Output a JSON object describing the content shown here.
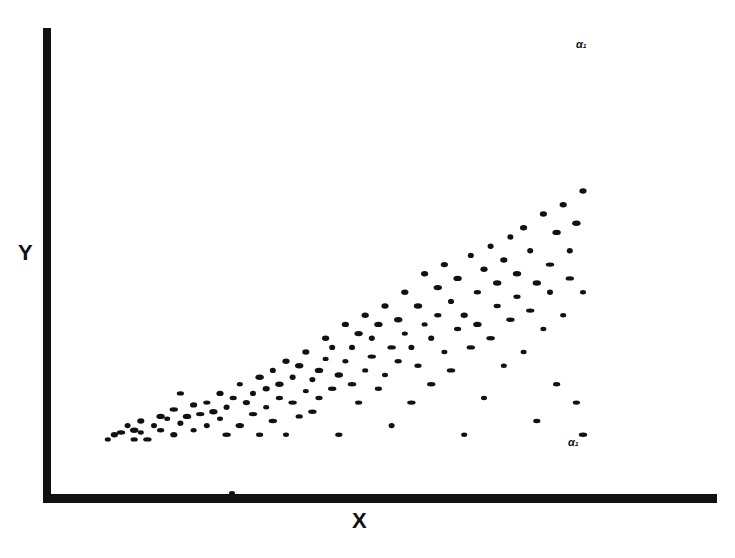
{
  "chart_data": {
    "type": "scatter",
    "title": "",
    "xlabel": "X",
    "ylabel": "Y",
    "grid": false,
    "legend": null,
    "ticks": {
      "x": [],
      "y": []
    },
    "xlim": [
      0,
      100
    ],
    "ylim": [
      0,
      100
    ],
    "annotations": [
      {
        "text": "α₁",
        "x": 82,
        "y": 98
      },
      {
        "text": "α₁",
        "x": 82,
        "y": 13
      }
    ],
    "points": [
      [
        8,
        11
      ],
      [
        9,
        12
      ],
      [
        10,
        12.5
      ],
      [
        11,
        14
      ],
      [
        12,
        11
      ],
      [
        12,
        13
      ],
      [
        13,
        12.5
      ],
      [
        13,
        15
      ],
      [
        14,
        11
      ],
      [
        15,
        14
      ],
      [
        16,
        13
      ],
      [
        16,
        16
      ],
      [
        17,
        15.5
      ],
      [
        18,
        12
      ],
      [
        18,
        17.5
      ],
      [
        19,
        14.5
      ],
      [
        19,
        21
      ],
      [
        20,
        16
      ],
      [
        21,
        13
      ],
      [
        21,
        18.5
      ],
      [
        22,
        16.5
      ],
      [
        23,
        14
      ],
      [
        23,
        19
      ],
      [
        24,
        17
      ],
      [
        25,
        15.5
      ],
      [
        25,
        21
      ],
      [
        26,
        12
      ],
      [
        26,
        18
      ],
      [
        27,
        20
      ],
      [
        28,
        14
      ],
      [
        28,
        23
      ],
      [
        29,
        19
      ],
      [
        30,
        16.5
      ],
      [
        30,
        21
      ],
      [
        31,
        12
      ],
      [
        31,
        24.5
      ],
      [
        32,
        18
      ],
      [
        32,
        22
      ],
      [
        33,
        15
      ],
      [
        33,
        26
      ],
      [
        34,
        20
      ],
      [
        34,
        23
      ],
      [
        35,
        12
      ],
      [
        35,
        28
      ],
      [
        36,
        19
      ],
      [
        36,
        24.5
      ],
      [
        37,
        16
      ],
      [
        37,
        27
      ],
      [
        38,
        21.5
      ],
      [
        38,
        30
      ],
      [
        39,
        17
      ],
      [
        39,
        24
      ],
      [
        40,
        20
      ],
      [
        40,
        26
      ],
      [
        41,
        28.5
      ],
      [
        41,
        33
      ],
      [
        42,
        22
      ],
      [
        42,
        31
      ],
      [
        43,
        12
      ],
      [
        43,
        25
      ],
      [
        44,
        28
      ],
      [
        44,
        36
      ],
      [
        45,
        23
      ],
      [
        45,
        31
      ],
      [
        46,
        19
      ],
      [
        46,
        34
      ],
      [
        47,
        26
      ],
      [
        47,
        38
      ],
      [
        48,
        29
      ],
      [
        48,
        33
      ],
      [
        49,
        22
      ],
      [
        49,
        36
      ],
      [
        50,
        25
      ],
      [
        50,
        40
      ],
      [
        51,
        31
      ],
      [
        51,
        14
      ],
      [
        52,
        28
      ],
      [
        52,
        37
      ],
      [
        53,
        34
      ],
      [
        53,
        43
      ],
      [
        54,
        19
      ],
      [
        54,
        31
      ],
      [
        55,
        27
      ],
      [
        55,
        40
      ],
      [
        56,
        36
      ],
      [
        56,
        47
      ],
      [
        57,
        23
      ],
      [
        57,
        33
      ],
      [
        58,
        38
      ],
      [
        58,
        44
      ],
      [
        59,
        30
      ],
      [
        59,
        49
      ],
      [
        60,
        26
      ],
      [
        60,
        41
      ],
      [
        61,
        35
      ],
      [
        61,
        46
      ],
      [
        62,
        12
      ],
      [
        62,
        38
      ],
      [
        63,
        31
      ],
      [
        63,
        51
      ],
      [
        64,
        43
      ],
      [
        64,
        36
      ],
      [
        65,
        20
      ],
      [
        65,
        48
      ],
      [
        66,
        33
      ],
      [
        66,
        53
      ],
      [
        67,
        40
      ],
      [
        67,
        45
      ],
      [
        68,
        27
      ],
      [
        68,
        50
      ],
      [
        69,
        37
      ],
      [
        69,
        55
      ],
      [
        70,
        42
      ],
      [
        70,
        47
      ],
      [
        71,
        30
      ],
      [
        71,
        57
      ],
      [
        72,
        39
      ],
      [
        72,
        52
      ],
      [
        73,
        15
      ],
      [
        73,
        45
      ],
      [
        74,
        35
      ],
      [
        74,
        60
      ],
      [
        75,
        49
      ],
      [
        75,
        43
      ],
      [
        76,
        23
      ],
      [
        76,
        56
      ],
      [
        77,
        38
      ],
      [
        77,
        62
      ],
      [
        78,
        46
      ],
      [
        78,
        52
      ],
      [
        79,
        19
      ],
      [
        79,
        58
      ],
      [
        80,
        43
      ],
      [
        80,
        65
      ],
      [
        80,
        12
      ]
    ]
  },
  "axes": {
    "x_label": "X",
    "y_label": "Y"
  }
}
